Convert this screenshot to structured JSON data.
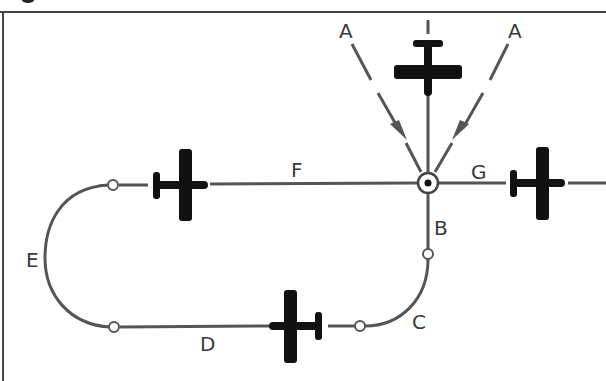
{
  "diagram": {
    "colors": {
      "line": "#555555",
      "aircraft": "#111111",
      "border": "#444444",
      "background": "#ffffff"
    },
    "labels": {
      "a_left": "A",
      "a_right": "A",
      "b": "B",
      "c": "C",
      "d": "D",
      "e": "E",
      "f": "F",
      "g": "G"
    },
    "elements": {
      "fix": "holding-fix (circle with dot)",
      "arrows": [
        "entry-arrow-left",
        "entry-arrow-right"
      ],
      "aircraft": [
        "aircraft-inbound-top",
        "aircraft-outbound-left-leg",
        "aircraft-inbound-leg",
        "aircraft-departing-right"
      ],
      "turn_points": [
        "turn-point-b",
        "turn-point-c",
        "turn-point-d",
        "turn-point-f"
      ]
    }
  }
}
